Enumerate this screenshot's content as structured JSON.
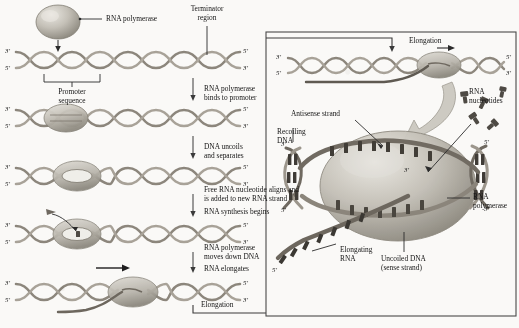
{
  "figure": {
    "title_implicit": "Transcription: RNA polymerase and DNA",
    "left_panel": {
      "polymerase_label": "RNA polymerase",
      "terminator_label_line1": "Terminator",
      "terminator_label_line2": "region",
      "promoter_label_line1": "Promoter",
      "promoter_label_line2": "sequence",
      "steps": [
        {
          "id": "step1",
          "lines": [
            "RNA polymerase",
            "binds to promoter"
          ]
        },
        {
          "id": "step2",
          "lines": [
            "DNA uncoils",
            "and separates"
          ]
        },
        {
          "id": "step3",
          "lines": [
            "Free RNA nucleotide aligns and",
            "is added to new RNA strand",
            "RNA synthesis begins"
          ]
        },
        {
          "id": "step4",
          "lines": [
            "RNA polymerase",
            "moves down DNA",
            "RNA elongates"
          ]
        },
        {
          "id": "step5",
          "lines": [
            "Elongation"
          ]
        }
      ],
      "strand_ends": [
        {
          "left_top": "3'",
          "left_bottom": "5'",
          "right_top": "5'",
          "right_bottom": "3'"
        },
        {
          "left_top": "3'",
          "left_bottom": "5'",
          "right_top": "5'",
          "right_bottom": "3'"
        },
        {
          "left_top": "3'",
          "left_bottom": "5'",
          "right_top": "5'",
          "right_bottom": "3'"
        },
        {
          "left_top": "3'",
          "left_bottom": "5'",
          "right_top": "5'",
          "right_bottom": "3'"
        },
        {
          "left_top": "3'",
          "left_bottom": "5'",
          "right_top": "5'",
          "right_bottom": "3'"
        }
      ]
    },
    "right_panel": {
      "elongation_label": "Elongation",
      "top_strand_ends": {
        "left_top": "3'",
        "left_bottom": "5'",
        "right_top": "5'",
        "right_bottom": "3'"
      },
      "labels": [
        {
          "id": "antisense",
          "text": "Antisense strand"
        },
        {
          "id": "recoiling",
          "text": "Recoiling\nDNA"
        },
        {
          "id": "rna_nucleotides",
          "text": "RNA\nnucleotides"
        },
        {
          "id": "rna_polymerase",
          "text": "RNA\npolymerase"
        },
        {
          "id": "elongating_rna",
          "text": "Elongating\nRNA"
        },
        {
          "id": "uncoiled_dna",
          "text": "Uncoiled DNA\n(sense strand)"
        }
      ],
      "detail_strand_ends": {
        "left_upper": "3'",
        "left_lower": "5'",
        "right_upper": "5'",
        "right_lower": "3'",
        "center_three": "3'",
        "rna_five": "5'"
      }
    },
    "colors": {
      "dna_backbone": "#8c867c",
      "dna_backbone_dark": "#6f6960",
      "polymerase_fill": "#c9c6bd",
      "polymerase_shadow": "#9b978d",
      "rna_strand": "#6d675e",
      "nucleotide": "#4e4a44",
      "ink": "#141414",
      "panel_border": "#4a4a4a",
      "background": "#faf9f7"
    }
  }
}
